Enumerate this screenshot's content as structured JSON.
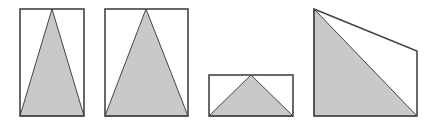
{
  "colors": {
    "background": "#ffffff",
    "stroke": "#444444",
    "fill": "#c9c9c9"
  },
  "figures": [
    {
      "id": "figure-1",
      "rect": {
        "x": 20,
        "y": 9,
        "w": 64,
        "h": 107
      },
      "triangle": [
        [
          20,
          116
        ],
        [
          52,
          9
        ],
        [
          84,
          116
        ]
      ]
    },
    {
      "id": "figure-2",
      "rect": {
        "x": 105,
        "y": 9,
        "w": 83,
        "h": 107
      },
      "triangle": [
        [
          105,
          116
        ],
        [
          146,
          9
        ],
        [
          188,
          116
        ]
      ]
    },
    {
      "id": "figure-3",
      "rect": {
        "x": 209,
        "y": 75,
        "w": 84,
        "h": 41
      },
      "triangle": [
        [
          209,
          116
        ],
        [
          251,
          75
        ],
        [
          293,
          116
        ]
      ]
    },
    {
      "id": "figure-4",
      "polygon": [
        [
          314,
          9
        ],
        [
          417,
          51
        ],
        [
          417,
          116
        ],
        [
          314,
          116
        ]
      ],
      "triangle": [
        [
          314,
          9
        ],
        [
          417,
          116
        ],
        [
          314,
          116
        ]
      ]
    }
  ]
}
